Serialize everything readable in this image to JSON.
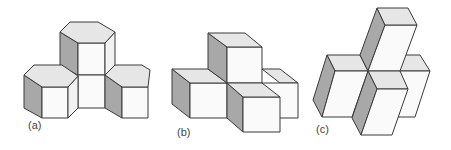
{
  "colors": {
    "stroke": "#3a3a3a",
    "top": "#e6e6e6",
    "front": "#fafafa",
    "side": "#a8a8a8"
  },
  "figures": [
    {
      "id": "a",
      "label": "(a)",
      "label_pos": [
        28,
        119
      ],
      "description": "Three hexagonal prisms arranged around a square column",
      "faces": [
        {
          "type": "side",
          "pts": [
            [
              60,
              32
            ],
            [
              78,
              43
            ],
            [
              78,
              75
            ],
            [
              60,
              66
            ]
          ]
        },
        {
          "type": "front",
          "pts": [
            [
              78,
              43
            ],
            [
              105,
              43
            ],
            [
              105,
              75
            ],
            [
              78,
              75
            ]
          ]
        },
        {
          "type": "side2",
          "pts": [
            [
              105,
              43
            ],
            [
              115,
              32
            ],
            [
              115,
              66
            ],
            [
              105,
              75
            ]
          ]
        },
        {
          "type": "top",
          "pts": [
            [
              70,
              22
            ],
            [
              98,
              22
            ],
            [
              115,
              32
            ],
            [
              105,
              43
            ],
            [
              78,
              43
            ],
            [
              60,
              32
            ]
          ]
        },
        {
          "type": "front",
          "pts": [
            [
              78,
              75
            ],
            [
              105,
              75
            ],
            [
              105,
              108
            ],
            [
              78,
              108
            ]
          ]
        },
        {
          "type": "side",
          "pts": [
            [
              24,
              75
            ],
            [
              42,
              87
            ],
            [
              42,
              118
            ],
            [
              24,
              108
            ]
          ]
        },
        {
          "type": "front",
          "pts": [
            [
              42,
              87
            ],
            [
              68,
              87
            ],
            [
              68,
              118
            ],
            [
              42,
              118
            ]
          ]
        },
        {
          "type": "side2",
          "pts": [
            [
              68,
              87
            ],
            [
              78,
              76
            ],
            [
              78,
              108
            ],
            [
              68,
              118
            ]
          ]
        },
        {
          "type": "top",
          "pts": [
            [
              34,
              65
            ],
            [
              62,
              65
            ],
            [
              78,
              76
            ],
            [
              68,
              87
            ],
            [
              42,
              87
            ],
            [
              24,
              75
            ]
          ]
        },
        {
          "type": "side",
          "pts": [
            [
              105,
              75
            ],
            [
              122,
              87
            ],
            [
              122,
              118
            ],
            [
              105,
              108
            ]
          ]
        },
        {
          "type": "front",
          "pts": [
            [
              122,
              87
            ],
            [
              148,
              87
            ],
            [
              148,
              118
            ],
            [
              122,
              118
            ]
          ]
        },
        {
          "type": "top",
          "pts": [
            [
              115,
              65
            ],
            [
              142,
              65
            ],
            [
              150,
              70
            ],
            [
              148,
              87
            ],
            [
              122,
              87
            ],
            [
              105,
              75
            ]
          ]
        }
      ]
    },
    {
      "id": "b",
      "label": "(b)",
      "label_pos": [
        177,
        126
      ],
      "description": "Four cubes: one on top, three in an L/cross on the base",
      "faces": [
        {
          "type": "top",
          "pts": [
            [
              262,
              69
            ],
            [
              280,
              69
            ],
            [
              298,
              83
            ],
            [
              280,
              83
            ]
          ]
        },
        {
          "type": "front",
          "pts": [
            [
              262,
              83
            ],
            [
              298,
              83
            ],
            [
              298,
              118
            ],
            [
              262,
              118
            ]
          ]
        },
        {
          "type": "side",
          "pts": [
            [
              172,
              69
            ],
            [
              190,
              83
            ],
            [
              190,
              118
            ],
            [
              172,
              104
            ]
          ]
        },
        {
          "type": "front",
          "pts": [
            [
              190,
              83
            ],
            [
              227,
              83
            ],
            [
              227,
              118
            ],
            [
              190,
              118
            ]
          ]
        },
        {
          "type": "top",
          "pts": [
            [
              172,
              69
            ],
            [
              208,
              69
            ],
            [
              227,
              83
            ],
            [
              190,
              83
            ]
          ]
        },
        {
          "type": "side",
          "pts": [
            [
              208,
              33
            ],
            [
              227,
              47
            ],
            [
              227,
              83
            ],
            [
              208,
              69
            ]
          ]
        },
        {
          "type": "front",
          "pts": [
            [
              227,
              47
            ],
            [
              262,
              47
            ],
            [
              262,
              83
            ],
            [
              227,
              83
            ]
          ]
        },
        {
          "type": "top",
          "pts": [
            [
              208,
              33
            ],
            [
              245,
              33
            ],
            [
              262,
              47
            ],
            [
              227,
              47
            ]
          ]
        },
        {
          "type": "side",
          "pts": [
            [
              227,
              83
            ],
            [
              243,
              97
            ],
            [
              243,
              132
            ],
            [
              227,
              118
            ]
          ]
        },
        {
          "type": "front",
          "pts": [
            [
              243,
              97
            ],
            [
              280,
              97
            ],
            [
              280,
              132
            ],
            [
              243,
              132
            ]
          ]
        },
        {
          "type": "top",
          "pts": [
            [
              227,
              83
            ],
            [
              262,
              83
            ],
            [
              280,
              97
            ],
            [
              243,
              97
            ]
          ]
        }
      ]
    },
    {
      "id": "c",
      "label": "(c)",
      "label_pos": [
        316,
        123
      ],
      "description": "Four slanted rectangular prisms radiating from a central vertex",
      "faces": [
        {
          "type": "top",
          "pts": [
            [
              400,
              55
            ],
            [
              420,
              55
            ],
            [
              430,
              71
            ],
            [
              397,
              71
            ]
          ]
        },
        {
          "type": "front",
          "pts": [
            [
              397,
              71
            ],
            [
              430,
              71
            ],
            [
              415,
              117
            ],
            [
              398,
              117
            ]
          ]
        },
        {
          "type": "top",
          "pts": [
            [
              327,
              55
            ],
            [
              360,
              55
            ],
            [
              368,
              71
            ],
            [
              335,
              71
            ]
          ]
        },
        {
          "type": "side",
          "pts": [
            [
              327,
              55
            ],
            [
              335,
              71
            ],
            [
              322,
              117
            ],
            [
              313,
              100
            ]
          ]
        },
        {
          "type": "front",
          "pts": [
            [
              335,
              71
            ],
            [
              368,
              71
            ],
            [
              352,
              117
            ],
            [
              322,
              117
            ]
          ]
        },
        {
          "type": "side",
          "pts": [
            [
              377,
              8
            ],
            [
              385,
              25
            ],
            [
              368,
              71
            ],
            [
              360,
              55
            ]
          ]
        },
        {
          "type": "front",
          "pts": [
            [
              385,
              25
            ],
            [
              417,
              25
            ],
            [
              400,
              71
            ],
            [
              368,
              71
            ]
          ]
        },
        {
          "type": "top",
          "pts": [
            [
              377,
              8
            ],
            [
              408,
              8
            ],
            [
              417,
              25
            ],
            [
              385,
              25
            ]
          ]
        },
        {
          "type": "top",
          "pts": [
            [
              368,
              71
            ],
            [
              400,
              71
            ],
            [
              408,
              89
            ],
            [
              377,
              89
            ]
          ]
        },
        {
          "type": "side",
          "pts": [
            [
              368,
              71
            ],
            [
              377,
              89
            ],
            [
              361,
              135
            ],
            [
              352,
              118
            ]
          ]
        },
        {
          "type": "front",
          "pts": [
            [
              377,
              89
            ],
            [
              408,
              89
            ],
            [
              392,
              135
            ],
            [
              361,
              135
            ]
          ]
        }
      ]
    }
  ]
}
